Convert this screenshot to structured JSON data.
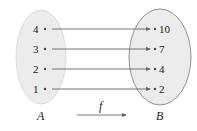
{
  "diagram": {
    "type": "function-mapping",
    "function_label": "f",
    "domain": {
      "label": "A",
      "elements": [
        "4",
        "3",
        "2",
        "1"
      ]
    },
    "codomain": {
      "label": "B",
      "elements": [
        "10",
        "7",
        "4",
        "2"
      ]
    },
    "mappings": [
      {
        "from": "4",
        "to": "10"
      },
      {
        "from": "3",
        "to": "7"
      },
      {
        "from": "2",
        "to": "4"
      },
      {
        "from": "1",
        "to": "2"
      }
    ],
    "colors": {
      "set_fill": "#ececec",
      "set_a_stroke": "#dddddd",
      "set_b_stroke": "#777777",
      "arrow": "#666666",
      "text": "#222222"
    }
  }
}
